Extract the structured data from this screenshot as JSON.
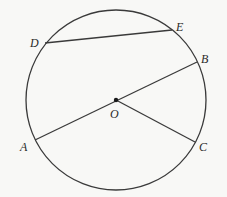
{
  "diagram": {
    "type": "circle-geometry",
    "circle": {
      "cx": 116,
      "cy": 100,
      "r": 90
    },
    "center": {
      "label": "O",
      "x": 116,
      "y": 100
    },
    "points": {
      "A": {
        "label": "A",
        "x": 35,
        "y": 140
      },
      "B": {
        "label": "B",
        "x": 197,
        "y": 62
      },
      "C": {
        "label": "C",
        "x": 195,
        "y": 142
      },
      "D": {
        "label": "D",
        "x": 45,
        "y": 43
      },
      "E": {
        "label": "E",
        "x": 172,
        "y": 30
      }
    },
    "segments": [
      {
        "name": "diameter-AB",
        "from": "A",
        "to": "B"
      },
      {
        "name": "radius-OC",
        "from": "O",
        "to": "C"
      },
      {
        "name": "chord-DE",
        "from": "D",
        "to": "E"
      }
    ],
    "colors": {
      "stroke": "#3a3a3a",
      "background": "#f8f8f6",
      "text": "#2a2a2a"
    }
  }
}
